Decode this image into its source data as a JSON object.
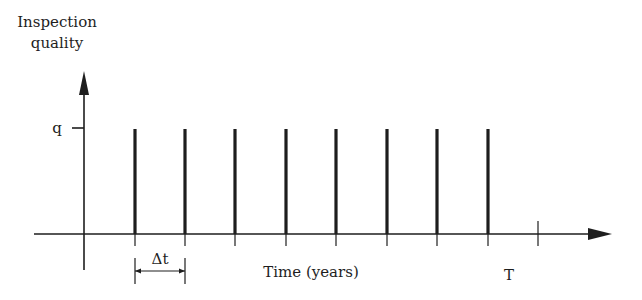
{
  "diagram": {
    "type": "inspection-schedule",
    "y_axis_label_line1": "Inspection",
    "y_axis_label_line2": "quality",
    "y_tick_label": "q",
    "x_axis_label": "Time (years)",
    "interval_label": "Δt",
    "end_label": "T",
    "inspection_count": 8,
    "inspection_quality": "q",
    "colors": {
      "ink": "#1e1e1e",
      "background": "#ffffff"
    }
  }
}
